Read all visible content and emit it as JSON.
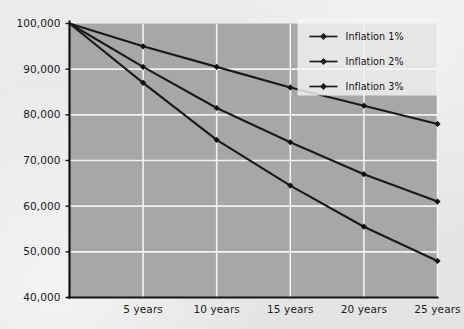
{
  "figure": {
    "background_color": "#e9e9e9",
    "plot_background_color": "#a7a7a7",
    "gridline_color": "#f2f2f2",
    "axis_color": "#141414",
    "series_color": "#1a1a1a"
  },
  "legend": {
    "position": "top-right",
    "background_color": "#f4f4f4",
    "entries": [
      {
        "label": "Inflation 1%",
        "marker": "diamond"
      },
      {
        "label": "Inflation 2%",
        "marker": "diamond"
      },
      {
        "label": "Inflation 3%",
        "marker": "diamond"
      }
    ]
  },
  "axes": {
    "y_ticks": [
      "100,000",
      "90,000",
      "80,000",
      "70,000",
      "60,000",
      "50,000",
      "40,000"
    ],
    "x_ticks": [
      "5 years",
      "10 years",
      "15 years",
      "20 years",
      "25 years"
    ]
  },
  "chart_data": {
    "type": "line",
    "title": "",
    "xlabel": "",
    "ylabel": "",
    "x": [
      0,
      5,
      10,
      15,
      20,
      25
    ],
    "categories": [
      "",
      "5 years",
      "10 years",
      "15 years",
      "20 years",
      "25 years"
    ],
    "ylim": [
      40000,
      100000
    ],
    "xlim": [
      0,
      25
    ],
    "ytick_values": [
      100000,
      90000,
      80000,
      70000,
      60000,
      50000,
      40000
    ],
    "ytick_labels": [
      "100,000",
      "90,000",
      "80,000",
      "70,000",
      "60,000",
      "50,000",
      "40,000"
    ],
    "xtick_values": [
      5,
      10,
      15,
      20,
      25
    ],
    "xtick_labels": [
      "5 years",
      "10 years",
      "15 years",
      "20 years",
      "25 years"
    ],
    "grid": true,
    "grid_axis": "both",
    "legend_position": "upper right",
    "marker": "diamond",
    "series": [
      {
        "name": "Inflation 1%",
        "values": [
          100000,
          95000,
          90500,
          86000,
          82000,
          78000
        ]
      },
      {
        "name": "Inflation 2%",
        "values": [
          100000,
          90500,
          81500,
          74000,
          67000,
          61000
        ]
      },
      {
        "name": "Inflation 3%",
        "values": [
          100000,
          87000,
          74500,
          64500,
          55500,
          48000
        ]
      }
    ]
  }
}
